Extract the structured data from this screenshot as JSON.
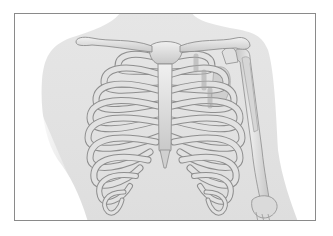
{
  "figure": {
    "caption": "",
    "parts": [
      "clavicle",
      "sternum",
      "ribs",
      "humerus",
      "forearm",
      "torso-silhouette"
    ]
  },
  "colors": {
    "background": "#ffffff",
    "frame_border": "#8a8a8a",
    "torso_fill": "#e4e4e4",
    "bone_fill": "#dcdcdc",
    "bone_stroke": "#8e8e8e",
    "bone_highlight": "#f2f2f2",
    "cartilage_fill": "#bdbdbd"
  }
}
